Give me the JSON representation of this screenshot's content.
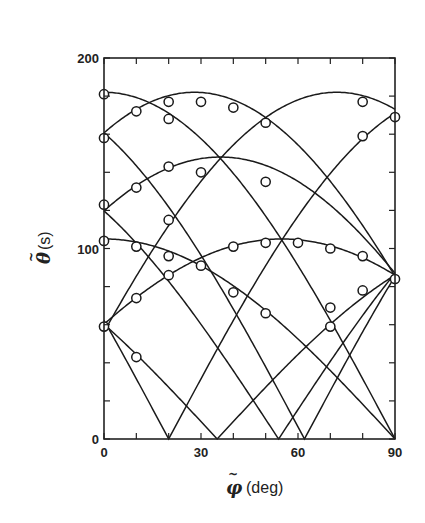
{
  "chart_data": {
    "type": "scatter",
    "title": "",
    "xlabel": "φ̃ (deg)",
    "xlabel_symbol": "φ",
    "xlabel_unit": "(deg)",
    "ylabel": "θ̃ (s)",
    "ylabel_symbol": "θ",
    "ylabel_unit": "(s)",
    "xlim": [
      0,
      90
    ],
    "ylim": [
      0,
      200
    ],
    "xticks": [
      0,
      30,
      60,
      90
    ],
    "xticks_minor": [
      0,
      10,
      20,
      30,
      40,
      50,
      60,
      70,
      80,
      90
    ],
    "yticks": [
      0,
      100,
      200
    ],
    "yticks_minor": [
      0,
      20,
      40,
      60,
      80,
      100,
      120,
      140,
      160,
      180,
      200
    ],
    "grid": false,
    "legend": "none",
    "points": [
      [
        0,
        181
      ],
      [
        0,
        158
      ],
      [
        0,
        123
      ],
      [
        0,
        104
      ],
      [
        0,
        59
      ],
      [
        10,
        172
      ],
      [
        10,
        132
      ],
      [
        10,
        101
      ],
      [
        10,
        74
      ],
      [
        10,
        43
      ],
      [
        20,
        177
      ],
      [
        20,
        168
      ],
      [
        20,
        143
      ],
      [
        20,
        115
      ],
      [
        20,
        96
      ],
      [
        20,
        86
      ],
      [
        30,
        177
      ],
      [
        30,
        140
      ],
      [
        30,
        91
      ],
      [
        40,
        174
      ],
      [
        40,
        101
      ],
      [
        40,
        77
      ],
      [
        50,
        166
      ],
      [
        50,
        135
      ],
      [
        50,
        103
      ],
      [
        50,
        66
      ],
      [
        60,
        103
      ],
      [
        70,
        100
      ],
      [
        70,
        69
      ],
      [
        70,
        59
      ],
      [
        80,
        177
      ],
      [
        80,
        159
      ],
      [
        80,
        96
      ],
      [
        80,
        78
      ],
      [
        90,
        169
      ],
      [
        90,
        84
      ]
    ],
    "curves": [
      {
        "name": "fit-1",
        "amplitude": 182,
        "phase_deg": 0
      },
      {
        "name": "fit-2",
        "amplitude": 182,
        "phase_deg": 72
      },
      {
        "name": "fit-3",
        "amplitude": 182,
        "phase_deg": 28
      },
      {
        "name": "fit-4",
        "amplitude": 182,
        "phase_deg": -28
      },
      {
        "name": "fit-5",
        "amplitude": 182,
        "phase_deg": -70
      },
      {
        "name": "fit-6",
        "amplitude": 148,
        "phase_deg": 36
      },
      {
        "name": "fit-7",
        "amplitude": 148,
        "phase_deg": -36
      },
      {
        "name": "fit-8",
        "amplitude": 105,
        "phase_deg": 0
      },
      {
        "name": "fit-9",
        "amplitude": 105,
        "phase_deg": 55
      },
      {
        "name": "fit-10",
        "amplitude": 105,
        "phase_deg": -55
      }
    ],
    "curve_formula": "θ = amplitude · |cos(φ − phase)|"
  }
}
